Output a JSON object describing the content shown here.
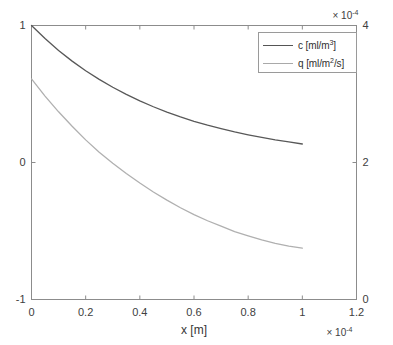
{
  "figure": {
    "ghost_text": "",
    "background": "#ffffff"
  },
  "axes": {
    "left": {
      "ticks": [
        "1",
        "0",
        "-1"
      ],
      "limits": [
        -1,
        1
      ],
      "color": "#404040"
    },
    "right": {
      "ticks": [
        "4",
        "2",
        "0"
      ],
      "limits": [
        0,
        4
      ],
      "exponent_label": "× 10",
      "exponent_sup": "-4",
      "color": "#404040"
    },
    "bottom": {
      "ticks": [
        "0",
        "0.2",
        "0.4",
        "0.6",
        "0.8",
        "1",
        "1.2"
      ],
      "limits": [
        0,
        1.2
      ],
      "label": "x [m]",
      "exponent_label": "× 10",
      "exponent_sup": "-4",
      "color": "#404040"
    },
    "box_color": "#8c8c8c"
  },
  "legend": {
    "entries": [
      {
        "prefix": "c  [ml/m",
        "sup": "3",
        "suffix": "]",
        "color": "#555555"
      },
      {
        "prefix": "q  [ml/m",
        "sup": "2",
        "suffix": "/s]",
        "color": "#a9a9a9"
      }
    ],
    "border_color": "#9a9a9a"
  },
  "chart_data": {
    "type": "line",
    "title": "",
    "xlabel": "x [m]",
    "ylabel": "",
    "xlim": [
      0,
      0.00012
    ],
    "ylim_left": [
      -1,
      1
    ],
    "ylim_right": [
      0,
      0.0004
    ],
    "x_exponent": -4,
    "y_right_exponent": -4,
    "xticks": [
      0,
      2e-05,
      4e-05,
      6e-05,
      8e-05,
      0.0001,
      0.00012
    ],
    "xticklabels": [
      "0",
      "0.2",
      "0.4",
      "0.6",
      "0.8",
      "1",
      "1.2"
    ],
    "yticks_left": [
      -1,
      0,
      1
    ],
    "yticklabels_left": [
      "1",
      "0",
      "-1"
    ],
    "yticks_right": [
      0,
      0.0002,
      0.0004
    ],
    "yticklabels_right": [
      "4",
      "2",
      "0"
    ],
    "grid": false,
    "legend_position": "upper right",
    "series": [
      {
        "name": "c [ml/m^3]",
        "axis": "left",
        "color": "#585858",
        "x": [
          0,
          5e-06,
          1e-05,
          1.5e-05,
          2e-05,
          2.5e-05,
          3e-05,
          3.5e-05,
          4e-05,
          4.5e-05,
          5e-05,
          5.5e-05,
          6e-05,
          6.5e-05,
          7e-05,
          7.5e-05,
          8e-05,
          8.5e-05,
          9e-05,
          9.5e-05,
          0.0001
        ],
        "y": [
          1.0,
          0.905,
          0.818,
          0.74,
          0.67,
          0.607,
          0.549,
          0.497,
          0.45,
          0.407,
          0.368,
          0.333,
          0.301,
          0.272,
          0.247,
          0.223,
          0.202,
          0.183,
          0.165,
          0.15,
          0.135
        ]
      },
      {
        "name": "q [ml/m^2/s]",
        "axis": "right",
        "color": "#b0b0b0",
        "x": [
          0,
          5e-06,
          1e-05,
          1.5e-05,
          2e-05,
          2.5e-05,
          3e-05,
          3.5e-05,
          4e-05,
          4.5e-05,
          5e-05,
          5.5e-05,
          6e-05,
          6.5e-05,
          7e-05,
          7.5e-05,
          8e-05,
          8.5e-05,
          9e-05,
          9.5e-05,
          0.0001
        ],
        "y": [
          0.000322,
          0.000297,
          0.000274,
          0.000253,
          0.000233,
          0.000215,
          0.000199,
          0.000184,
          0.00017,
          0.000157,
          0.000145,
          0.000134,
          0.000124,
          0.000115,
          0.000107,
          9.9e-05,
          9.3e-05,
          8.7e-05,
          8.2e-05,
          7.8e-05,
          7.5e-05
        ]
      }
    ]
  }
}
